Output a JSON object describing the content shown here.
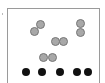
{
  "figure": {
    "frame_color": "#9a9a9a",
    "gray_circles": [
      {
        "x": 36,
        "y": 20
      },
      {
        "x": 30,
        "y": 27
      },
      {
        "x": 76,
        "y": 19
      },
      {
        "x": 76,
        "y": 28
      },
      {
        "x": 51,
        "y": 37
      },
      {
        "x": 59,
        "y": 37
      },
      {
        "x": 39,
        "y": 53
      },
      {
        "x": 48,
        "y": 53
      }
    ],
    "black_dots": [
      {
        "x": 22,
        "y": 68
      },
      {
        "x": 38,
        "y": 68
      },
      {
        "x": 56,
        "y": 68
      },
      {
        "x": 73,
        "y": 68
      },
      {
        "x": 84,
        "y": 68
      }
    ],
    "colors": {
      "gray": "#a8a8a8",
      "black": "#111111"
    }
  }
}
